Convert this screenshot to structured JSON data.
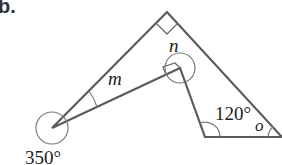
{
  "part_label": "b.",
  "colors": {
    "line": "#5a5a5a",
    "text": "#222222"
  },
  "angles": {
    "m": "m",
    "n": "n",
    "o": "o",
    "reflex_left": "350°",
    "bottom_left": "120°"
  }
}
